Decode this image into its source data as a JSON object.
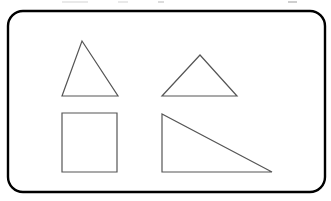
{
  "figure": {
    "canvas": {
      "width": 331,
      "height": 201,
      "background": "#ffffff"
    },
    "frame": {
      "name": "rounded-rectangle-frame",
      "x": 8,
      "y": 11,
      "width": 317,
      "height": 181,
      "corner_radius": 15,
      "stroke_color": "#000000",
      "stroke_width": 2.4,
      "fill_color": "#ffffff"
    },
    "shape_style": {
      "stroke_color": "#555555",
      "stroke_width": 1.2,
      "fill": "none"
    },
    "shapes": [
      {
        "id": "triangle-upper-left",
        "label": "Triangle",
        "type": "triangle",
        "variant": "isosceles-tall",
        "points": "82,41 118,96 62,96",
        "vertices": [
          [
            82,
            41
          ],
          [
            118,
            96
          ],
          [
            62,
            96
          ]
        ],
        "base_width": 56,
        "height": 55
      },
      {
        "id": "triangle-upper-right",
        "label": "Triangle",
        "type": "triangle",
        "variant": "isosceles-wide",
        "points": "200,55 237,96 162,96",
        "vertices": [
          [
            200,
            55
          ],
          [
            237,
            96
          ],
          [
            162,
            96
          ]
        ],
        "base_width": 75,
        "height": 41
      },
      {
        "id": "square-lower-left",
        "label": "Square",
        "type": "square",
        "points": "62,113 117,113 117,172 62,172",
        "vertices": [
          [
            62,
            113
          ],
          [
            117,
            113
          ],
          [
            117,
            172
          ],
          [
            62,
            172
          ]
        ],
        "base_width": 55,
        "height": 59
      },
      {
        "id": "right-triangle-lower-right",
        "label": "Right triangle",
        "type": "triangle",
        "variant": "right-angled",
        "points": "162,114 162,172 272,172",
        "vertices": [
          [
            162,
            114
          ],
          [
            162,
            172
          ],
          [
            272,
            172
          ]
        ],
        "base_width": 110,
        "height": 58
      }
    ],
    "artifacts": {
      "name": "cropped-text-remnants",
      "color": "#e9e9e9",
      "count": 4
    }
  }
}
